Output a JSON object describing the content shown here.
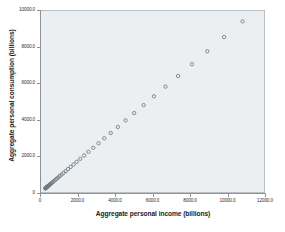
{
  "chart_data": {
    "type": "scatter",
    "title": "",
    "xlabel": "Aggregate personal income (billions)",
    "ylabel": "Aggregate personal consumption (billions)",
    "xlim": [
      0,
      12000
    ],
    "ylim": [
      0,
      10000
    ],
    "xticks": [
      0,
      2000,
      4000,
      6000,
      8000,
      10000,
      12000
    ],
    "yticks": [
      0,
      2000,
      4000,
      6000,
      8000,
      10000
    ],
    "xtick_labels": [
      "0",
      "2000.0",
      "4000.0",
      "6000.0",
      "8000.0",
      "10000.0",
      "12000.0"
    ],
    "ytick_labels": [
      "0",
      "2000.0",
      "4000.0",
      "6000.0",
      "8000.0",
      "10000.0"
    ],
    "grid": false,
    "legend": "none",
    "marker": {
      "shape": "circle-open",
      "edge_color": "#6e7880",
      "fill_color": "none",
      "size_px": 3.4
    },
    "plot_background": "#eceff1",
    "frame_color": "#b9bfc4",
    "series": [
      {
        "name": "Income vs Consumption",
        "points": [
          [
            231,
            198
          ],
          [
            242,
            207
          ],
          [
            250,
            215
          ],
          [
            260,
            224
          ],
          [
            272,
            235
          ],
          [
            285,
            246
          ],
          [
            300,
            259
          ],
          [
            318,
            274
          ],
          [
            337,
            291
          ],
          [
            358,
            309
          ],
          [
            382,
            330
          ],
          [
            410,
            354
          ],
          [
            441,
            381
          ],
          [
            476,
            411
          ],
          [
            515,
            445
          ],
          [
            558,
            483
          ],
          [
            606,
            525
          ],
          [
            659,
            572
          ],
          [
            717,
            623
          ],
          [
            781,
            679
          ],
          [
            852,
            741
          ],
          [
            930,
            809
          ],
          [
            1016,
            884
          ],
          [
            1110,
            966
          ],
          [
            1214,
            1056
          ],
          [
            1329,
            1155
          ],
          [
            1456,
            1265
          ],
          [
            1596,
            1387
          ],
          [
            1751,
            1522
          ],
          [
            1923,
            1671
          ],
          [
            2113,
            1836
          ],
          [
            2323,
            2019
          ],
          [
            2555,
            2221
          ],
          [
            2812,
            2445
          ],
          [
            3096,
            2692
          ],
          [
            3409,
            2965
          ],
          [
            3753,
            3265
          ],
          [
            4133,
            3595
          ],
          [
            4552,
            3959
          ],
          [
            5014,
            4360
          ],
          [
            5523,
            4801
          ],
          [
            6083,
            5287
          ],
          [
            6699,
            5822
          ],
          [
            7377,
            6411
          ],
          [
            8124,
            7060
          ],
          [
            8946,
            7774
          ],
          [
            9851,
            8559
          ],
          [
            10849,
            9425
          ]
        ]
      }
    ],
    "n_points": 48,
    "relationship": "strong positive linear"
  }
}
